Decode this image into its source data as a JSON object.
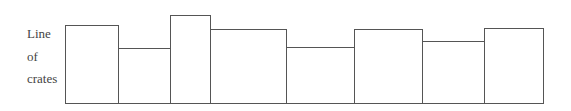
{
  "label": {
    "lines": [
      "Line",
      "of",
      "crates"
    ]
  },
  "style": {
    "stroke": "#555555",
    "text_color": "#444444"
  },
  "baseline_y": 103,
  "crates": [
    {
      "left": 65,
      "right": 118,
      "top": 25
    },
    {
      "left": 118,
      "right": 170,
      "top": 48
    },
    {
      "left": 170,
      "right": 210,
      "top": 15
    },
    {
      "left": 210,
      "right": 286,
      "top": 29
    },
    {
      "left": 286,
      "right": 354,
      "top": 47
    },
    {
      "left": 354,
      "right": 422,
      "top": 29
    },
    {
      "left": 422,
      "right": 484,
      "top": 41
    },
    {
      "left": 484,
      "right": 543,
      "top": 28
    }
  ]
}
